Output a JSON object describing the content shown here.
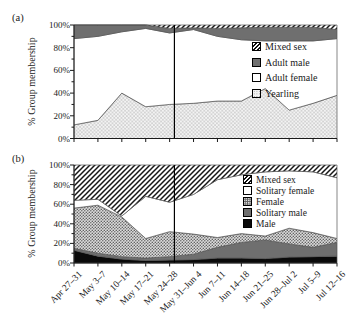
{
  "colors": {
    "dark_gray": "#6f6f6f",
    "black": "#0a0a0a",
    "axis": "#1a1a1a",
    "area_outline": "#555555",
    "hatch_line": "#161616",
    "vline": "#000000"
  },
  "chart_data": [
    {
      "type": "area",
      "stacked": true,
      "panel_label": "(a)",
      "ylabel": "% Group membership",
      "ylim": [
        0,
        100
      ],
      "y_ticks": [
        "0%",
        "20%",
        "40%",
        "60%",
        "80%",
        "100%"
      ],
      "grid": false,
      "legend_position": "inside-right",
      "x_tick_labels_shown": false,
      "categories": [
        "Apr 27–31",
        "May 3–7",
        "May 10–14",
        "May 17–21",
        "May 24–28",
        "May 31–Jun 4",
        "Jun 7–11",
        "Jun 14–18",
        "Jun 21–25",
        "Jun 28–Jul 2",
        "Jul 5–9",
        "Jul 12–16"
      ],
      "series": [
        {
          "name": "Yearling",
          "swatch": "stipple",
          "values": [
            12,
            16,
            40,
            28,
            30,
            31,
            33,
            33,
            44,
            25,
            31,
            38
          ]
        },
        {
          "name": "Adult female",
          "swatch": "white",
          "values": [
            76,
            74,
            54,
            69,
            63,
            65,
            57,
            54,
            42,
            61,
            55,
            50
          ]
        },
        {
          "name": "Adult male",
          "swatch": "solid-dark",
          "values": [
            12,
            10,
            6,
            3,
            4,
            1.5,
            7,
            10.5,
            12,
            12,
            12,
            8
          ]
        },
        {
          "name": "Mixed sex",
          "swatch": "hatch",
          "values": [
            0,
            0,
            0,
            0,
            3,
            2.5,
            3,
            2.5,
            2,
            2,
            2,
            4
          ]
        }
      ],
      "annotation_vline": {
        "type": "vertical-line",
        "between_categories": [
          "May 24–28",
          "May 31–Jun 4"
        ],
        "category_index_position": 4.2
      }
    },
    {
      "type": "area",
      "stacked": true,
      "panel_label": "(b)",
      "ylabel": "% Group membership",
      "ylim": [
        0,
        100
      ],
      "y_ticks": [
        "0%",
        "20%",
        "40%",
        "60%",
        "80%",
        "100%"
      ],
      "grid": false,
      "legend_position": "inside-right",
      "x_tick_labels_shown": true,
      "categories": [
        "Apr 27–31",
        "May 3–7",
        "May 10–14",
        "May 17–21",
        "May 24–28",
        "May 31–Jun 4",
        "Jun 7–11",
        "Jun 14–18",
        "Jun 21–25",
        "Jun 28–Jul 2",
        "Jul 5–9",
        "Jul 12–16"
      ],
      "series": [
        {
          "name": "Male",
          "swatch": "black",
          "values": [
            13,
            7,
            4,
            2.5,
            3,
            3.5,
            5,
            5,
            4.5,
            6,
            6.5,
            7
          ]
        },
        {
          "name": "Solitary male",
          "swatch": "solid-dark",
          "values": [
            2,
            3,
            2.5,
            2.5,
            3.5,
            5.5,
            11,
            16,
            19,
            13.5,
            9.5,
            14
          ]
        },
        {
          "name": "Female",
          "swatch": "dense",
          "values": [
            41,
            49,
            40.5,
            20,
            25.5,
            20.5,
            10,
            9,
            4,
            16,
            15,
            4
          ]
        },
        {
          "name": "Solitary female",
          "swatch": "white",
          "values": [
            8,
            6,
            1,
            43,
            30,
            40.5,
            59,
            60,
            65.5,
            58.5,
            62,
            62
          ]
        },
        {
          "name": "Mixed sex",
          "swatch": "hatch",
          "values": [
            36,
            35,
            52,
            32,
            38,
            30,
            15,
            10,
            7,
            6,
            7,
            13
          ]
        }
      ],
      "annotation_vline": {
        "type": "vertical-line",
        "between_categories": [
          "May 24–28",
          "May 31–Jun 4"
        ],
        "category_index_position": 4.2
      }
    }
  ]
}
